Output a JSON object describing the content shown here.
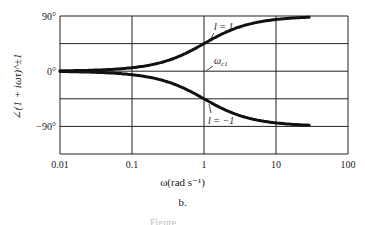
{
  "chart_data": {
    "type": "line",
    "title": "",
    "subtitle": "b.",
    "xlabel": "ω(rad s⁻¹)",
    "ylabel": "∠(1 + iωτ)^±1",
    "xscale": "log",
    "xlim": [
      0.01,
      100
    ],
    "ylim": [
      -135,
      90
    ],
    "x_ticks": [
      "0.01",
      "0.1",
      "1",
      "10",
      "100"
    ],
    "y_ticks": [
      "90°",
      "0°",
      "−90°"
    ],
    "grid": true,
    "series": [
      {
        "name": "l = 1",
        "x": [
          0.01,
          0.03,
          0.1,
          0.2,
          0.5,
          1,
          2,
          5,
          10,
          30
        ],
        "values": [
          0.6,
          1.7,
          5.7,
          11.3,
          26.6,
          45,
          63.4,
          78.7,
          84.3,
          88.1
        ]
      },
      {
        "name": "l = −1",
        "x": [
          0.01,
          0.03,
          0.1,
          0.2,
          0.5,
          1,
          2,
          5,
          10,
          30
        ],
        "values": [
          -0.6,
          -1.7,
          -5.7,
          -11.3,
          -26.6,
          -45,
          -63.4,
          -78.7,
          -84.3,
          -88.1
        ]
      }
    ],
    "annotations": [
      {
        "text": "l = 1",
        "target": "upper curve near ω=1"
      },
      {
        "text": "ω_c1",
        "target": "ω = 1 at 0°"
      },
      {
        "text": "l = −1",
        "target": "lower curve near ω=1"
      }
    ]
  },
  "labels": {
    "x_ticks": [
      "0.01",
      "0.1",
      "1",
      "10",
      "100"
    ],
    "y_90": "90°",
    "y_0": "0°",
    "y_m90": "−90°",
    "xlabel": "ω(rad s⁻¹)",
    "ylabel": "∠(1 + iωτ)^±1",
    "subplot": "b.",
    "caption": "Figure"
  },
  "annotation_labels": {
    "l_pos": "l = 1",
    "wc": "ω",
    "wc_sub": "c1",
    "l_neg": "l = −1"
  }
}
